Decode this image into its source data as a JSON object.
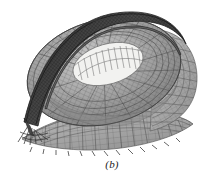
{
  "figure": {
    "caption": "(b)",
    "view": "oblique perspective",
    "rendering": "grayscale line mesh with shaded surfaces",
    "background_color": "#ffffff",
    "ink_color": "#3a3a3a"
  },
  "palette": {
    "arch_dark": "#3d3d3d",
    "arch_mid": "#555555",
    "bowl_shade": "#8d8d8d",
    "bowl_light": "#b4b4b4",
    "wing_fill": "#a5a5a5",
    "wing_edge": "#6e6e6e",
    "mesh_line": "#6b6b6b",
    "opening_fill": "#f2f2f0",
    "rib_line": "#8a8a8a",
    "support_tick": "#4a4a4a",
    "paper": "#ffffff"
  },
  "components": [
    {
      "id": "main-arch",
      "label": "primary diagonal arch truss",
      "tone": "#3d3d3d",
      "description": "dark lattice arch spanning from upper right over the bowl down to the lower left support"
    },
    {
      "id": "roof-bowl",
      "label": "elliptical roof bowl shell",
      "tone": "#8d8d8d",
      "description": "doubly curved ellipsoidal cable-net / lattice roof surface"
    },
    {
      "id": "central-opening",
      "label": "central oval opening",
      "tone": "#f2f2f0",
      "description": "bright elliptical aperture over the playing field with radial rib members"
    },
    {
      "id": "right-wing",
      "label": "right cantilever canopy",
      "tone": "#a5a5a5",
      "description": "large curved cantilevered wing surface with fine quadrilateral mesh"
    },
    {
      "id": "lower-wing",
      "label": "lower cantilever canopy",
      "tone": "#a5a5a5",
      "description": "broad tapering wing plate with orthogonal grid and boundary support ticks"
    },
    {
      "id": "left-support",
      "label": "left arch base support",
      "tone": "#4a4a4a",
      "description": "pointed splayed strut cluster at the arch springing point"
    },
    {
      "id": "boundary-supports",
      "label": "perimeter support ticks",
      "tone": "#4a4a4a",
      "description": "short tick marks along the lower free edge representing restraints"
    }
  ],
  "mesh": {
    "type": "quadrilateral shell elements",
    "ring_divisions": 34,
    "radial_divisions": 26,
    "arch_panel_count": 40
  }
}
